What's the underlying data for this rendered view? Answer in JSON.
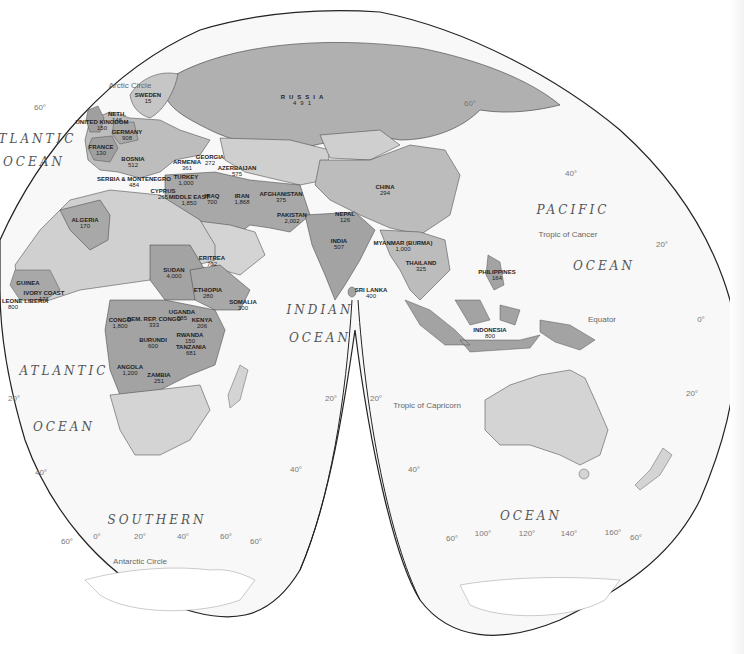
{
  "map": {
    "projection": "interrupted goode homolosine (eastern hemisphere)",
    "colors": {
      "background": "#ffffff",
      "ocean": "#f7f7f7",
      "land_light": "#d6d6d6",
      "land_medium": "#bcbcbc",
      "land_dark": "#a3a3a3",
      "border": "#3a3a3a",
      "outline": "#222222"
    },
    "oceans": [
      {
        "id": "atlantic-north-1",
        "text": "ATLANTIC",
        "x": 32,
        "y": 139
      },
      {
        "id": "atlantic-north-2",
        "text": "OCEAN",
        "x": 34,
        "y": 162
      },
      {
        "id": "atlantic-south-1",
        "text": "ATLANTIC",
        "x": 64,
        "y": 371
      },
      {
        "id": "atlantic-south-2",
        "text": "OCEAN",
        "x": 64,
        "y": 427
      },
      {
        "id": "indian-1",
        "text": "INDIAN",
        "x": 320,
        "y": 310
      },
      {
        "id": "indian-2",
        "text": "OCEAN",
        "x": 320,
        "y": 338
      },
      {
        "id": "pacific-1",
        "text": "PACIFIC",
        "x": 573,
        "y": 210
      },
      {
        "id": "pacific-2",
        "text": "OCEAN",
        "x": 604,
        "y": 266
      },
      {
        "id": "southern-1",
        "text": "SOUTHERN",
        "x": 157,
        "y": 520
      },
      {
        "id": "southern-2",
        "text": "OCEAN",
        "x": 531,
        "y": 516
      }
    ],
    "reference_lines": [
      {
        "id": "arctic-circle",
        "text": "Arctic Circle",
        "x": 130,
        "y": 85
      },
      {
        "id": "tropic-cancer",
        "text": "Tropic of Cancer",
        "x": 568,
        "y": 234
      },
      {
        "id": "equator",
        "text": "Equator",
        "x": 602,
        "y": 319
      },
      {
        "id": "tropic-capricorn",
        "text": "Tropic of Capricorn",
        "x": 427,
        "y": 405
      },
      {
        "id": "antarctic-circle",
        "text": "Antarctic Circle",
        "x": 140,
        "y": 561
      }
    ],
    "degree_labels": [
      {
        "text": "60°",
        "x": 40,
        "y": 107
      },
      {
        "text": "60°",
        "x": 470,
        "y": 103
      },
      {
        "text": "40°",
        "x": 571,
        "y": 173
      },
      {
        "text": "20°",
        "x": 662,
        "y": 244
      },
      {
        "text": "0°",
        "x": 701,
        "y": 319
      },
      {
        "text": "20°",
        "x": 14,
        "y": 398
      },
      {
        "text": "20°",
        "x": 331,
        "y": 398
      },
      {
        "text": "20°",
        "x": 376,
        "y": 398
      },
      {
        "text": "20°",
        "x": 692,
        "y": 393
      },
      {
        "text": "40°",
        "x": 41,
        "y": 472
      },
      {
        "text": "40°",
        "x": 296,
        "y": 469
      },
      {
        "text": "40°",
        "x": 414,
        "y": 469
      },
      {
        "text": "60°",
        "x": 67,
        "y": 541
      },
      {
        "text": "0°",
        "x": 97,
        "y": 536
      },
      {
        "text": "20°",
        "x": 140,
        "y": 536
      },
      {
        "text": "40°",
        "x": 183,
        "y": 536
      },
      {
        "text": "60°",
        "x": 226,
        "y": 536
      },
      {
        "text": "60°",
        "x": 256,
        "y": 541
      },
      {
        "text": "60°",
        "x": 452,
        "y": 538
      },
      {
        "text": "100°",
        "x": 483,
        "y": 533
      },
      {
        "text": "120°",
        "x": 527,
        "y": 533
      },
      {
        "text": "140°",
        "x": 569,
        "y": 533
      },
      {
        "text": "160°",
        "x": 613,
        "y": 532
      },
      {
        "text": "60°",
        "x": 636,
        "y": 537
      }
    ],
    "countries": [
      {
        "name": "RUSSIA",
        "value": "491",
        "x": 304,
        "y": 100,
        "cls": "russia"
      },
      {
        "name": "SWEDEN",
        "value": "15",
        "x": 148,
        "y": 98
      },
      {
        "name": "NETH.",
        "value": "146",
        "x": 117,
        "y": 117
      },
      {
        "name": "UNITED KINGDOM",
        "value": "150",
        "x": 102,
        "y": 125
      },
      {
        "name": "GERMANY",
        "value": "908",
        "x": 127,
        "y": 135
      },
      {
        "name": "FRANCE",
        "value": "130",
        "x": 101,
        "y": 150
      },
      {
        "name": "BOSNIA",
        "value": "512",
        "x": 133,
        "y": 162
      },
      {
        "name": "SERBIA & MONTENEGRO",
        "value": "484",
        "x": 134,
        "y": 182
      },
      {
        "name": "ARMENIA",
        "value": "361",
        "x": 187,
        "y": 165
      },
      {
        "name": "GEORGIA",
        "value": "272",
        "x": 210,
        "y": 160
      },
      {
        "name": "AZERBAIJAN",
        "value": "575",
        "x": 237,
        "y": 171
      },
      {
        "name": "TURKEY",
        "value": "1,000",
        "x": 186,
        "y": 180
      },
      {
        "name": "CYPRUS",
        "value": "265",
        "x": 163,
        "y": 194
      },
      {
        "name": "MIDDLE EAST",
        "value": "1,850",
        "x": 189,
        "y": 200
      },
      {
        "name": "IRAQ",
        "value": "700",
        "x": 212,
        "y": 199
      },
      {
        "name": "IRAN",
        "value": "1,868",
        "x": 242,
        "y": 199
      },
      {
        "name": "AFGHANISTAN",
        "value": "375",
        "x": 281,
        "y": 197
      },
      {
        "name": "PAKISTAN",
        "value": "2,002",
        "x": 292,
        "y": 218
      },
      {
        "name": "CHINA",
        "value": "294",
        "x": 385,
        "y": 190
      },
      {
        "name": "NEPAL",
        "value": "126",
        "x": 345,
        "y": 217
      },
      {
        "name": "INDIA",
        "value": "507",
        "x": 339,
        "y": 244
      },
      {
        "name": "MYANMAR (BURMA)",
        "value": "1,000",
        "x": 403,
        "y": 246
      },
      {
        "name": "THAILAND",
        "value": "325",
        "x": 421,
        "y": 266
      },
      {
        "name": "SRI LANKA",
        "value": "400",
        "x": 371,
        "y": 293
      },
      {
        "name": "PHILIPPINES",
        "value": "164",
        "x": 497,
        "y": 275
      },
      {
        "name": "INDONESIA",
        "value": "800",
        "x": 490,
        "y": 333
      },
      {
        "name": "ALGERIA",
        "value": "170",
        "x": 85,
        "y": 223
      },
      {
        "name": "SUDAN",
        "value": "4,000",
        "x": 174,
        "y": 273
      },
      {
        "name": "ERITREA",
        "value": "702",
        "x": 212,
        "y": 261
      },
      {
        "name": "ETHIOPIA",
        "value": "280",
        "x": 208,
        "y": 293
      },
      {
        "name": "SOMALIA",
        "value": "300",
        "x": 243,
        "y": 305
      },
      {
        "name": "GUINEA",
        "value": "",
        "x": 28,
        "y": 283
      },
      {
        "name": "SIERRA LEONE LIBERIA",
        "value": "800",
        "x": 13,
        "y": 304
      },
      {
        "name": "IVORY COAST",
        "value": "171",
        "x": 44,
        "y": 296
      },
      {
        "name": "CONGO",
        "value": "1,800",
        "x": 120,
        "y": 323
      },
      {
        "name": "DEM. REP. CONGO",
        "value": "333",
        "x": 154,
        "y": 322
      },
      {
        "name": "UGANDA",
        "value": "585",
        "x": 182,
        "y": 315
      },
      {
        "name": "KENYA",
        "value": "206",
        "x": 202,
        "y": 323
      },
      {
        "name": "BURUNDI",
        "value": "600",
        "x": 153,
        "y": 343
      },
      {
        "name": "RWANDA",
        "value": "150",
        "x": 190,
        "y": 338
      },
      {
        "name": "TANZANIA",
        "value": "681",
        "x": 191,
        "y": 350
      },
      {
        "name": "ANGOLA",
        "value": "1,200",
        "x": 130,
        "y": 370
      },
      {
        "name": "ZAMBIA",
        "value": "251",
        "x": 159,
        "y": 378
      }
    ]
  }
}
